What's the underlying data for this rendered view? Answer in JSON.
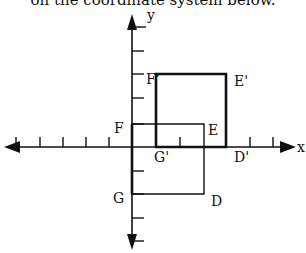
{
  "caption": "on the coordinate system below.",
  "axes": {
    "x_label": "x",
    "y_label": "y",
    "origin_px": [
      132,
      147
    ],
    "unit_px": 23.5
  },
  "labels": {
    "F": "F",
    "F_prime": "F'",
    "E": "E",
    "E_prime": "E'",
    "G": "G",
    "G_prime": "G'",
    "D": "D",
    "D_prime": "D'"
  },
  "figures": {
    "original": {
      "G": [
        0,
        -2
      ],
      "D": [
        3,
        -2
      ],
      "E": [
        3,
        1
      ],
      "F": [
        0,
        1
      ]
    },
    "image": {
      "G_prime": [
        1,
        0
      ],
      "D_prime": [
        4,
        0
      ],
      "E_prime": [
        4,
        3
      ],
      "F_prime": [
        1,
        3
      ]
    }
  },
  "colors": {
    "stroke": "#111111",
    "background": "#ffffff"
  }
}
